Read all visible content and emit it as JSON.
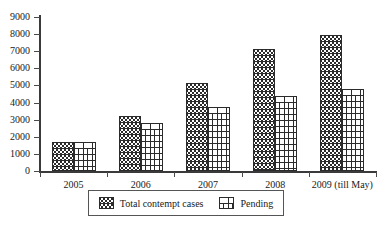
{
  "chart_data": {
    "type": "bar",
    "title": "",
    "subtitle": "",
    "xlabel": "",
    "ylabel": "",
    "categories": [
      "2005",
      "2006",
      "2007",
      "2008",
      "2009 (till May)"
    ],
    "series": [
      {
        "name": "Total contempt cases",
        "pattern": "wavy-hatch",
        "values": [
          1700,
          3200,
          5150,
          7150,
          7950
        ]
      },
      {
        "name": "Pending",
        "pattern": "brick-hatch",
        "values": [
          1700,
          2800,
          3750,
          4400,
          4800
        ]
      }
    ],
    "ylim": [
      0,
      9000
    ],
    "ytick_labels": [
      "0",
      "1000",
      "2000",
      "3000",
      "4000",
      "5000",
      "6000",
      "7000",
      "8000",
      "9000"
    ],
    "ytick_values": [
      0,
      1000,
      2000,
      3000,
      4000,
      5000,
      6000,
      7000,
      8000,
      9000
    ],
    "grid": false,
    "legend_position": "bottom",
    "colors": {
      "axis": "#3a3a3a",
      "bar_outline": "#2b2b2b",
      "bar_fill": "#ffffff",
      "text": "#1a1a1a",
      "background": "#ffffff",
      "legend_border": "#555555"
    }
  }
}
